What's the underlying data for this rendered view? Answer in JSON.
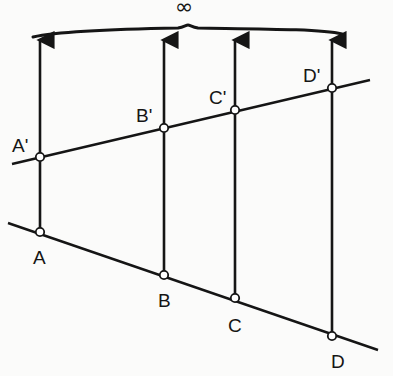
{
  "diagram": {
    "type": "parallel-projection",
    "stroke_color": "#151515",
    "background": "#fbfbfa",
    "infinity_label": "∞",
    "brace": {
      "from": [
        33,
        37
      ],
      "to": [
        342,
        33
      ],
      "peak": [
        188,
        26
      ]
    },
    "upper_line": {
      "from": [
        12,
        164
      ],
      "to": [
        370,
        80
      ]
    },
    "lower_line": {
      "from": [
        8,
        223
      ],
      "to": [
        378,
        350
      ]
    },
    "points": [
      {
        "id": "A",
        "label": "A",
        "x": 40,
        "y": 232,
        "label_x": 33,
        "label_y": 264
      },
      {
        "id": "B",
        "label": "B",
        "x": 164,
        "y": 275,
        "label_x": 158,
        "label_y": 307
      },
      {
        "id": "C",
        "label": "C",
        "x": 235,
        "y": 298,
        "label_x": 228,
        "label_y": 332
      },
      {
        "id": "D",
        "label": "D",
        "x": 332,
        "y": 336,
        "label_x": 331,
        "label_y": 368
      },
      {
        "id": "A2",
        "label": "A'",
        "x": 40,
        "y": 157,
        "label_x": 12,
        "label_y": 152
      },
      {
        "id": "B2",
        "label": "B'",
        "x": 164,
        "y": 128,
        "label_x": 136,
        "label_y": 122
      },
      {
        "id": "C2",
        "label": "C'",
        "x": 235,
        "y": 110,
        "label_x": 209,
        "label_y": 104
      },
      {
        "id": "D2",
        "label": "D'",
        "x": 332,
        "y": 88,
        "label_x": 303,
        "label_y": 82
      }
    ],
    "projection_rays": [
      {
        "x": 40,
        "bottom": 232,
        "top": 40
      },
      {
        "x": 164,
        "bottom": 275,
        "top": 40
      },
      {
        "x": 235,
        "bottom": 298,
        "top": 40
      },
      {
        "x": 332,
        "bottom": 336,
        "top": 40
      }
    ]
  }
}
